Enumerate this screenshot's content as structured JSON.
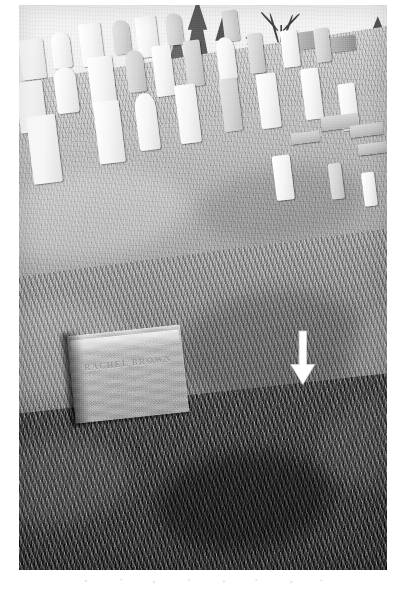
{
  "page": {
    "background_color": "#ffffff",
    "width": 403,
    "height": 592
  },
  "photograph": {
    "name": "cemetery-hillside-photograph",
    "medium": "black-and-white scanned photographic print",
    "alt_text": "Black and white photograph of a sloping cemetery hillside with rows of white upright headstones, a bare deciduous tree on the horizon, and a flat granite grave marker in the lower left foreground. A white arrow points downward at the right.",
    "frame": {
      "left": 19,
      "top": 5,
      "width": 368,
      "height": 565
    },
    "tones": {
      "sky": "#f1f1ef",
      "far_ground": "#c6c6c0",
      "mid_ground": "#b0b0a9",
      "near_ground": "#8e8e87",
      "foreground_grass": "#2d2d29",
      "headstone_light": "#f7f7f4",
      "headstone_shadow": "#bdbdb7",
      "arrow": "#ffffff"
    },
    "horizon_tilt_degrees": -8
  },
  "scene": {
    "sky": {
      "name": "sky",
      "description": "bright overcast sky, nearly white"
    },
    "tree": {
      "name": "bare-deciduous-tree",
      "description": "leafless deciduous tree silhouetted against the sky near the right of the horizon"
    },
    "conifers": {
      "name": "evergreen-trees",
      "description": "dark evergreen trees clustered along the upper horizon"
    },
    "hillside": {
      "name": "grassy-hillside",
      "description": "grass-covered slope tilting down to the left, dry winter turf"
    },
    "headstone_rows": [
      {
        "name": "headstone-row-back",
        "count": 9
      },
      {
        "name": "headstone-row-middle",
        "count": 10
      },
      {
        "name": "headstone-row-front",
        "count": 7
      }
    ],
    "foreground_marker": {
      "name": "foreground-grave-marker",
      "type": "flat granite slab marker with beveled top edge",
      "condition": "weathered, inscription largely illegible",
      "inscription_lines": [
        "RACHEL BROWN",
        "1841 — 1908",
        "AT REST"
      ],
      "inscription_legibility": "illegible"
    }
  },
  "annotations": [
    {
      "name": "arrow-annotation",
      "icon": "arrow-down-icon",
      "color": "#ffffff",
      "direction": "down",
      "description": "white downward-pointing arrow drawn on the photograph indicating a grave location in the turf"
    }
  ],
  "scan_artifacts": {
    "name": "scan-speckle-marks",
    "description": "faint speckle marks on the white page below the photograph"
  }
}
